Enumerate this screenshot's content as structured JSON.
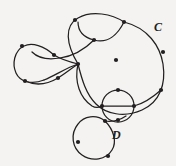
{
  "figure": {
    "kind": "knot-diagram",
    "background_color": "#f4f3f1",
    "stroke_color": "#231f20",
    "width": 176,
    "height": 166,
    "labels": [
      {
        "id": "C",
        "text": "C",
        "x": 154,
        "y": 21
      },
      {
        "id": "D",
        "text": "D",
        "x": 112,
        "y": 129
      }
    ],
    "label_c": "C",
    "label_d": "D",
    "curves": [
      {
        "name": "large-outer-loop-C",
        "d": "M 124 22 C 148 28 160 46 163 64 C 166 84 160 102 142 110 C 124 118 106 114 96 104 C 86 94 82 80 78 64"
      },
      {
        "name": "upper-left-arc",
        "d": "M 78 64 C 66 44 64 26 78 18 C 92 10 112 14 124 22"
      },
      {
        "name": "upper-inner-lens",
        "d": "M 124 22 C 118 34 108 44 94 40 C 82 37 78 30 78 22"
      },
      {
        "name": "inner-sweep-to-center",
        "d": "M 94 40 C 86 48 74 56 60 58 C 48 60 38 58 32 52"
      },
      {
        "name": "left-loop-upper",
        "d": "M 54 55 C 44 46 32 42 24 46 C 14 51 12 64 16 73 C 20 82 32 85 44 80"
      },
      {
        "name": "left-loop-lower",
        "d": "M 44 80 C 56 75 66 68 78 64"
      },
      {
        "name": "left-loop-cross-upper",
        "d": "M 54 55 C 62 60 70 62 78 64"
      },
      {
        "name": "left-loop-cross-lower",
        "d": "M 25 81 C 36 86 48 84 58 78 C 66 73 72 68 78 64"
      },
      {
        "name": "center-down-to-circle",
        "d": "M 78 64 C 74 82 80 98 92 106 C 97 109 100 107 102 106"
      },
      {
        "name": "small-circle-D",
        "d": "M 118 90 C 127 90 134 97 134 106 C 134 115 127 122 118 122 C 109 122 102 115 102 106 C 102 97 109 90 118 90 Z"
      },
      {
        "name": "circle-chord-horizontal",
        "d": "M 102 106 L 134 106"
      },
      {
        "name": "right-arc-into-circle",
        "d": "M 134 106 C 142 104 152 98 161 90"
      },
      {
        "name": "bottom-loop-D",
        "d": "M 105 121 C 96 114 84 116 78 124 C 70 134 72 148 82 155 C 92 162 106 160 112 150 C 117 142 114 130 105 121"
      },
      {
        "name": "bottom-loop-tail",
        "d": "M 105 121 C 112 122 120 120 126 116"
      }
    ],
    "vertices": [
      {
        "name": "vertex-top",
        "x": 75,
        "y": 20
      },
      {
        "name": "vertex-upper-right-crossing",
        "x": 124,
        "y": 22
      },
      {
        "name": "vertex-inner-upper",
        "x": 94,
        "y": 40
      },
      {
        "name": "vertex-right-upper",
        "x": 163,
        "y": 52
      },
      {
        "name": "vertex-left-loop-top",
        "x": 22,
        "y": 46
      },
      {
        "name": "vertex-left-loop-inner",
        "x": 54,
        "y": 55
      },
      {
        "name": "vertex-inner-lens-right",
        "x": 116,
        "y": 60
      },
      {
        "name": "vertex-center-crossing",
        "x": 78,
        "y": 64
      },
      {
        "name": "vertex-left-loop-bottom",
        "x": 25,
        "y": 81
      },
      {
        "name": "vertex-left-loop-cross",
        "x": 58,
        "y": 78
      },
      {
        "name": "vertex-right-lower",
        "x": 161,
        "y": 90
      },
      {
        "name": "vertex-circle-top",
        "x": 118,
        "y": 90
      },
      {
        "name": "vertex-circle-left",
        "x": 102,
        "y": 106
      },
      {
        "name": "vertex-circle-right",
        "x": 134,
        "y": 106
      },
      {
        "name": "vertex-circle-bottom",
        "x": 118,
        "y": 120
      },
      {
        "name": "vertex-bottom-loop-cross",
        "x": 105,
        "y": 121
      },
      {
        "name": "vertex-bottom-loop-left",
        "x": 78,
        "y": 142
      },
      {
        "name": "vertex-bottom-loop-bottom",
        "x": 108,
        "y": 156
      }
    ]
  }
}
